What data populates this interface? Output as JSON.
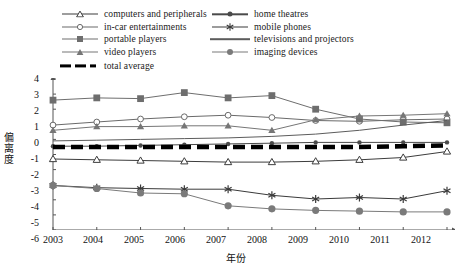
{
  "chart_data": {
    "type": "line",
    "title": "",
    "xlabel": "年份",
    "ylabel": "偏离度",
    "xlim": [
      2003,
      2012
    ],
    "ylim": [
      -6,
      4
    ],
    "yticks": [
      4,
      3,
      2,
      1,
      0,
      -1,
      -2,
      -3,
      -4,
      -5,
      -6
    ],
    "grid": false,
    "legend_position": "top",
    "categories": [
      "2003",
      "2004",
      "2005",
      "2006",
      "2007",
      "2008",
      "2009",
      "2010",
      "2011",
      "2012"
    ],
    "series": [
      {
        "name": "computers and peripherals",
        "marker": "triangle-open",
        "color": "#3c3c3c",
        "values": [
          -1.3,
          -1.35,
          -1.4,
          -1.45,
          -1.5,
          -1.5,
          -1.45,
          -1.35,
          -1.2,
          -0.8
        ]
      },
      {
        "name": "in-car entertainments",
        "marker": "circle-open",
        "color": "#6a6a6a",
        "values": [
          0.95,
          1.15,
          1.35,
          1.5,
          1.6,
          1.45,
          1.25,
          1.2,
          1.3,
          1.35
        ]
      },
      {
        "name": "portable players",
        "marker": "square-filled",
        "color": "#6e6e6e",
        "values": [
          2.6,
          2.75,
          2.7,
          3.1,
          2.75,
          2.9,
          2.0,
          1.35,
          1.15,
          1.1
        ]
      },
      {
        "name": "video players",
        "marker": "triangle-filled",
        "color": "#767676",
        "values": [
          0.6,
          0.85,
          0.85,
          0.9,
          0.9,
          0.6,
          1.3,
          1.55,
          1.6,
          1.7
        ]
      },
      {
        "name": "home theatres",
        "marker": "circle-small-filled",
        "color": "#4a4a4a",
        "values": [
          -0.45,
          -0.45,
          -0.4,
          -0.35,
          -0.3,
          -0.25,
          -0.2,
          -0.2,
          -0.2,
          -0.2
        ]
      },
      {
        "name": "mobile phones",
        "marker": "asterisk",
        "color": "#3a3a3a",
        "values": [
          -3.05,
          -3.2,
          -3.25,
          -3.3,
          -3.3,
          -3.7,
          -3.95,
          -3.85,
          -3.95,
          -3.4
        ]
      },
      {
        "name": "televisions and projectors",
        "marker": "none",
        "color": "#5c5c5c",
        "values": [
          -0.1,
          -0.05,
          0.0,
          0.05,
          0.1,
          0.2,
          0.35,
          0.6,
          0.95,
          1.25
        ]
      },
      {
        "name": "imaging devices",
        "marker": "circle-filled",
        "color": "#7a7a7a",
        "values": [
          -3.05,
          -3.25,
          -3.55,
          -3.6,
          -4.4,
          -4.6,
          -4.7,
          -4.75,
          -4.8,
          -4.8
        ]
      },
      {
        "name": "total average",
        "marker": "thick-dashed",
        "color": "#000000",
        "values": [
          -0.5,
          -0.5,
          -0.5,
          -0.5,
          -0.5,
          -0.5,
          -0.5,
          -0.5,
          -0.45,
          -0.4
        ]
      }
    ]
  },
  "legend": {
    "items": [
      {
        "label": "computers and peripherals",
        "icon": "triangle-open-marker"
      },
      {
        "label": "home theatres",
        "icon": "circle-small-filled-marker"
      },
      {
        "label": "in-car entertainments",
        "icon": "circle-open-marker"
      },
      {
        "label": "mobile phones",
        "icon": "asterisk-marker"
      },
      {
        "label": "portable players",
        "icon": "square-filled-marker"
      },
      {
        "label": "televisions and projectors",
        "icon": "plain-line-marker"
      },
      {
        "label": "video players",
        "icon": "triangle-filled-marker"
      },
      {
        "label": "imaging devices",
        "icon": "circle-filled-marker"
      },
      {
        "label": "total average",
        "icon": "thick-dashed-marker"
      }
    ]
  },
  "axes": {
    "y_label": "偏离度",
    "x_label": "年份",
    "y_ticks": [
      "4",
      "3",
      "2",
      "1",
      "0",
      "-1",
      "-2",
      "-3",
      "-4",
      "-5",
      "-6"
    ],
    "x_ticks": [
      "2003",
      "2004",
      "2005",
      "2006",
      "2007",
      "2008",
      "2009",
      "2010",
      "2011",
      "2012"
    ]
  },
  "colors": {
    "axis": "#555555",
    "text": "#111111",
    "average": "#000000"
  }
}
